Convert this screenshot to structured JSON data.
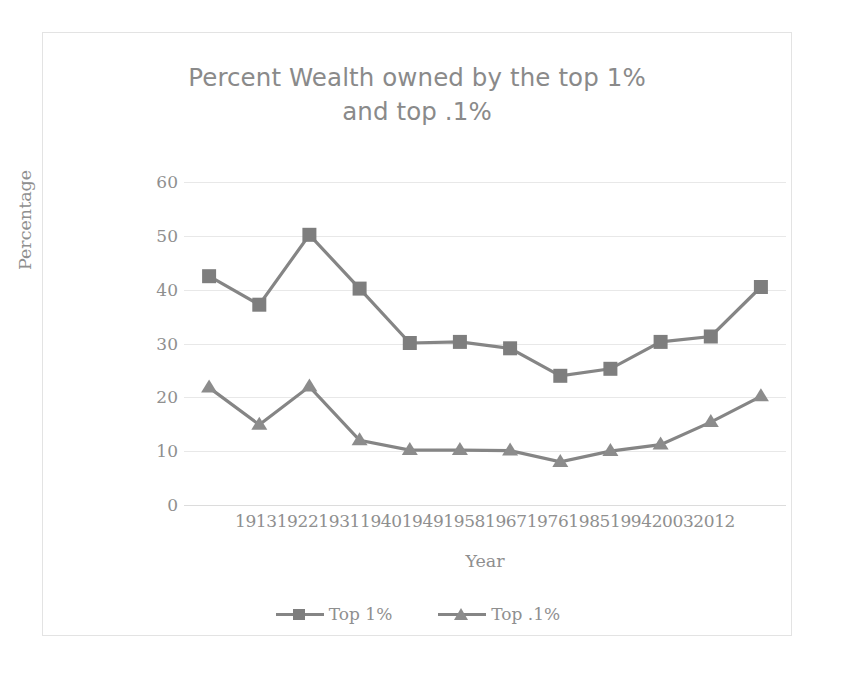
{
  "chart_data": {
    "type": "line",
    "title": "Percent Wealth owned by the top 1%\nand top .1%",
    "xlabel": "Year",
    "ylabel": "Percentage",
    "ylim": [
      0,
      60
    ],
    "yticks": [
      60,
      50,
      40,
      30,
      20,
      10,
      0
    ],
    "grid": true,
    "legend_position": "bottom",
    "categories": [
      "1913",
      "1922",
      "1931",
      "1940",
      "1949",
      "1958",
      "1967",
      "1976",
      "1985",
      "1994",
      "2003",
      "2012"
    ],
    "series": [
      {
        "name": "Top 1%",
        "marker": "square",
        "color": "#7e7e7e",
        "values": [
          42.5,
          37.2,
          50.2,
          40.2,
          30.1,
          30.3,
          29.1,
          24.0,
          25.3,
          30.3,
          31.3,
          40.5
        ]
      },
      {
        "name": "Top .1%",
        "marker": "triangle",
        "color": "#8c8c8c",
        "values": [
          21.8,
          14.9,
          22.0,
          12.0,
          10.2,
          10.2,
          10.1,
          8.0,
          10.0,
          11.2,
          15.4,
          20.2
        ]
      }
    ]
  },
  "legend": {
    "items": [
      {
        "label": "Top 1%"
      },
      {
        "label": "Top .1%"
      }
    ]
  },
  "colors": {
    "series_line": "#858585",
    "gridline": "#e8e8e8",
    "text": "#8f8f8f",
    "frame_border": "#e3e3e3",
    "background": "#ffffff"
  }
}
